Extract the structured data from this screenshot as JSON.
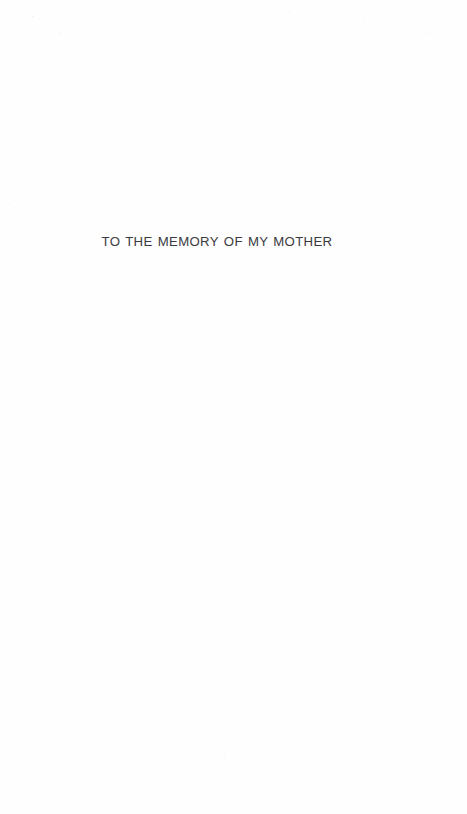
{
  "document": {
    "kind": "book-dedication-page",
    "page_background_color": "#fefefe",
    "text_color": "#3a3a3e"
  },
  "dedication": {
    "line": "TO THE MEMORY OF MY MOTHER"
  }
}
